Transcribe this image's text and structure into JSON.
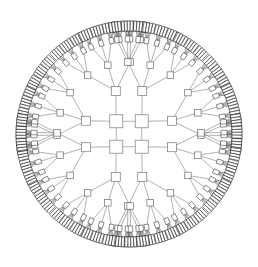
{
  "figure": {
    "kind": "radial-tree-graph-drawing",
    "title": "",
    "caption": "",
    "background_color": "#ffffff",
    "canvas": {
      "width": 258,
      "height": 267
    }
  },
  "chart_data": {
    "type": "diagram",
    "subtype": "radial-balanced-tree",
    "title": "",
    "xlabel": "",
    "ylabel": "",
    "grid": false,
    "legend": null,
    "annotations": [],
    "layout": {
      "center_x": 129,
      "center_y": 134,
      "outer_radius": 118,
      "symmetry_fold": 4,
      "ring_radii": [
        18,
        45,
        72,
        95,
        108
      ],
      "ring_count": 5
    },
    "node_levels": [
      {
        "level": 0,
        "name": "core",
        "count": 4,
        "node_size": 13,
        "radius": 18,
        "stroke": "#8a8a8a"
      },
      {
        "level": 1,
        "name": "ring2",
        "count": 8,
        "node_size": 9,
        "radius": 45,
        "stroke": "#7f7f7f"
      },
      {
        "level": 2,
        "name": "ring3",
        "count": 24,
        "node_size": 6.5,
        "radius": 72,
        "stroke": "#6e6e6e"
      },
      {
        "level": 3,
        "name": "ring4",
        "count": 72,
        "node_size": 4.2,
        "radius": 95,
        "stroke": "#4a4a4a"
      },
      {
        "level": 4,
        "name": "leaf",
        "count": 288,
        "node_size": 3.0,
        "radius": 108,
        "stroke": "#1c1c1c"
      }
    ],
    "branching": {
      "core_to_ring2": 2,
      "ring2_to_ring3": 3,
      "ring3_to_ring4": 3,
      "ring4_to_leaf": 4
    },
    "edge_shades": [
      "#9a9a9a",
      "#8f8f8f",
      "#7d7d7d",
      "#5e5e5e",
      "#2e2e2e"
    ],
    "total_nodes": 396,
    "core_cycle": true
  },
  "colors": {
    "background": "#ffffff",
    "node_fill": "#ffffff",
    "inner_stroke": "#8a8a8a",
    "outer_stroke": "#1c1c1c",
    "edge_inner": "#9a9a9a",
    "edge_outer": "#2e2e2e"
  }
}
